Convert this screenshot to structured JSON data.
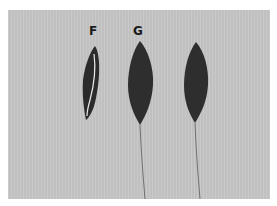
{
  "figure": {
    "labels": {
      "f": "F",
      "g": "G"
    },
    "colors": {
      "background": "#c6c6c6",
      "seed": "#2b2b2b",
      "border": "#ffffff"
    },
    "specimens": [
      {
        "label": "F",
        "description": "narrow seed, split with pale edge"
      },
      {
        "label": "G",
        "description": "lanceolate seed with long awn"
      },
      {
        "label": "",
        "description": "lanceolate seed with long awn"
      }
    ]
  }
}
